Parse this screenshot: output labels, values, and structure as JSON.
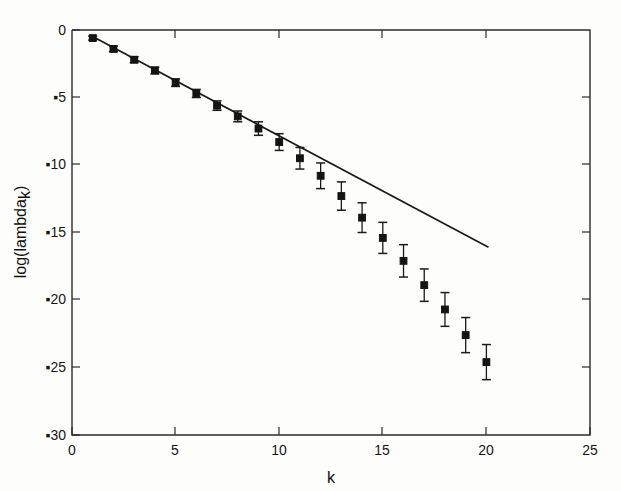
{
  "figure": {
    "background_color": "#fdfdfc",
    "ink_color": "#141414",
    "minus_glyph": "▪",
    "bleed_through_note": "faint mirrored text from reverse page (illegible)"
  },
  "chart_data": {
    "type": "scatter",
    "title": "",
    "xlabel": "k",
    "ylabel": "log(lambda_k)",
    "ylabel_base": "log(lambda",
    "ylabel_subscript": "k",
    "ylabel_close": ")",
    "xlim": [
      0,
      25
    ],
    "ylim": [
      -30,
      0
    ],
    "xticks": [
      0,
      5,
      10,
      15,
      20,
      25
    ],
    "xticklabels": [
      "0",
      "5",
      "10",
      "15",
      "20",
      "25"
    ],
    "yticks": [
      0,
      -5,
      -10,
      -15,
      -20,
      -25,
      -30
    ],
    "yticklabels": [
      "0",
      "▪5",
      "▪10",
      "▪15",
      "▪20",
      "▪25",
      "▪30"
    ],
    "grid": false,
    "legend": "none",
    "series": [
      {
        "name": "log(lambda_k) with error bars",
        "marker": "filled-square",
        "x": [
          1,
          2,
          3,
          4,
          5,
          6,
          7,
          8,
          9,
          10,
          11,
          12,
          13,
          14,
          15,
          16,
          17,
          18,
          19,
          20
        ],
        "y": [
          -0.6,
          -1.4,
          -2.2,
          -3.0,
          -3.9,
          -4.7,
          -5.6,
          -6.4,
          -7.3,
          -8.3,
          -9.5,
          -10.8,
          -12.3,
          -13.9,
          -15.4,
          -17.1,
          -18.9,
          -20.7,
          -22.6,
          -24.6
        ],
        "yerr": [
          0.15,
          0.2,
          0.22,
          0.25,
          0.28,
          0.3,
          0.35,
          0.4,
          0.5,
          0.62,
          0.8,
          0.95,
          1.05,
          1.1,
          1.15,
          1.2,
          1.2,
          1.25,
          1.3,
          1.3
        ]
      },
      {
        "name": "linear fit (reference line)",
        "type": "line",
        "x": [
          0.95,
          20.1
        ],
        "y": [
          -0.45,
          -16.1
        ],
        "slope": -0.818,
        "intercept": 0.33
      }
    ],
    "annotations": []
  }
}
